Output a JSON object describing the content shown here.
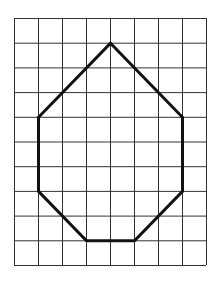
{
  "grid": {
    "columns": 8,
    "rows": 10,
    "origin_x": 14,
    "origin_y": 18,
    "cell_width": 24,
    "cell_height": 24.7,
    "line_color": "#333333",
    "line_width": 1
  },
  "polygon": {
    "name": "heptagon",
    "vertices": [
      [
        4,
        1
      ],
      [
        7,
        4
      ],
      [
        7,
        7
      ],
      [
        5,
        9
      ],
      [
        3,
        9
      ],
      [
        1,
        7
      ],
      [
        1,
        4
      ]
    ],
    "stroke_color": "#111111",
    "stroke_width": 3
  }
}
